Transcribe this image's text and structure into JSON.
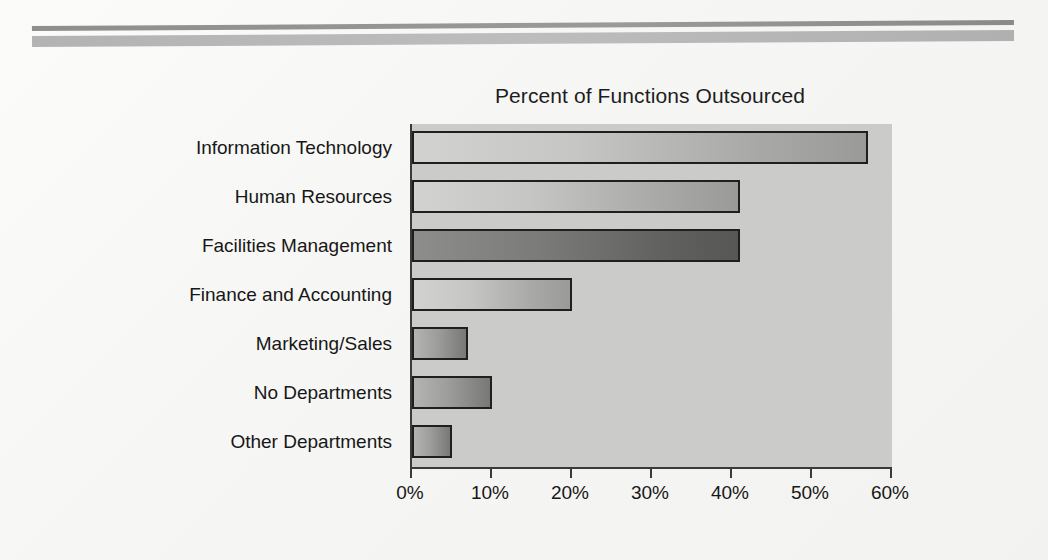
{
  "chart_data": {
    "type": "bar",
    "orientation": "horizontal",
    "title": "Percent of Functions Outsourced",
    "xlabel": "",
    "ylabel": "",
    "categories": [
      "Information Technology",
      "Human Resources",
      "Facilities Management",
      "Finance and Accounting",
      "Marketing/Sales",
      "No Departments",
      "Other Departments"
    ],
    "values": [
      57,
      41,
      41,
      20,
      7,
      10,
      5
    ],
    "value_suffix": "%",
    "xlim": [
      0,
      60
    ],
    "xticks": [
      0,
      10,
      20,
      30,
      40,
      50,
      60
    ],
    "xtick_labels": [
      "0%",
      "10%",
      "20%",
      "30%",
      "40%",
      "50%",
      "60%"
    ],
    "grid": false,
    "legend": "none",
    "bar_styles": [
      "light",
      "light",
      "dark",
      "light",
      "mid",
      "mid",
      "mid"
    ],
    "plot_background": "#cbcbca",
    "axis_color": "#3a3a3a",
    "text_color": "#171717"
  },
  "decor": {
    "rule_top_color": "#8e8e8e",
    "rule_bottom_color": "#b3b3b3"
  }
}
